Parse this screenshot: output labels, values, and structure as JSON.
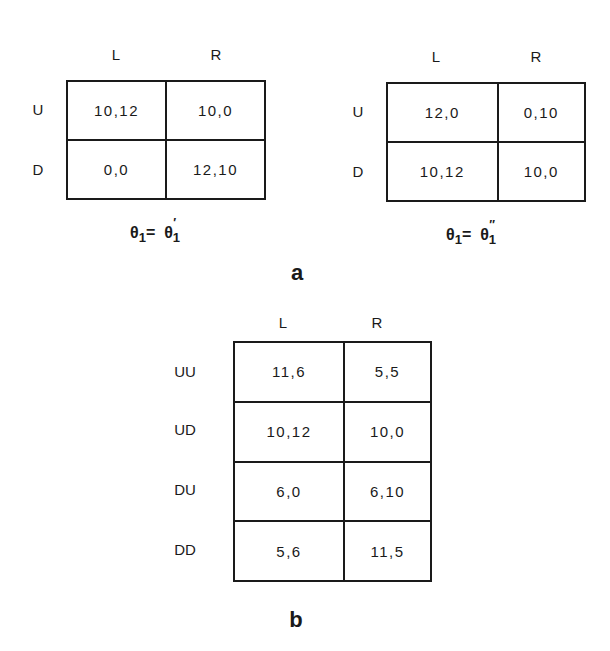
{
  "panel_a": {
    "label": "a",
    "left_game": {
      "col_headers": [
        "L",
        "R"
      ],
      "row_headers": [
        "U",
        "D"
      ],
      "cells": [
        [
          "10,12",
          "10,0"
        ],
        [
          "0,0",
          "12,10"
        ]
      ],
      "caption": {
        "lhs": "θ",
        "lhs_sub": "1",
        "eq": "=",
        "rhs": "θ",
        "rhs_prime": "′",
        "rhs_sub": "1"
      }
    },
    "right_game": {
      "col_headers": [
        "L",
        "R"
      ],
      "row_headers": [
        "U",
        "D"
      ],
      "cells": [
        [
          "12,0",
          "0,10"
        ],
        [
          "10,12",
          "10,0"
        ]
      ],
      "caption": {
        "lhs": "θ",
        "lhs_sub": "1",
        "eq": "=",
        "rhs": "θ",
        "rhs_prime": "″",
        "rhs_sub": "1"
      }
    }
  },
  "panel_b": {
    "label": "b",
    "col_headers": [
      "L",
      "R"
    ],
    "row_headers": [
      "UU",
      "UD",
      "DU",
      "DD"
    ],
    "cells": [
      [
        "11,6",
        "5,5"
      ],
      [
        "10,12",
        "10,0"
      ],
      [
        "6,0",
        "6,10"
      ],
      [
        "5,6",
        "11,5"
      ]
    ]
  }
}
